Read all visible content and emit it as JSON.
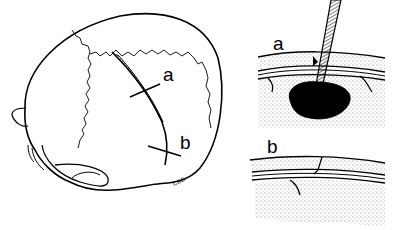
{
  "figure": {
    "skull": {
      "label_a": "a",
      "label_b": "b",
      "signature": "CBC"
    },
    "panel_a": {
      "label": "a"
    },
    "panel_b": {
      "label": "b"
    }
  },
  "colors": {
    "ink": "#000000",
    "paper": "#ffffff"
  }
}
